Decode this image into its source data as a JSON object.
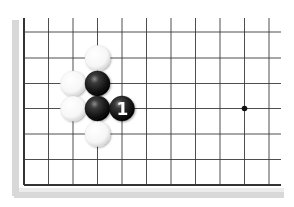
{
  "diagram": {
    "type": "go-board-fragment",
    "colors": {
      "background": "#ffffff",
      "line": "#3a3a3a",
      "edge_line": "#333333",
      "shadow": "#d8d8d8",
      "black_stone": "#1e1e1e",
      "white_stone": "#ffffff",
      "label_on_black": "#ffffff"
    },
    "grid": {
      "x": [
        24,
        48.5,
        73,
        97.5,
        122,
        146.5,
        171,
        195.5,
        220,
        244.5,
        269
      ],
      "y": [
        32,
        58,
        83.5,
        108.5,
        134,
        159.5,
        185
      ],
      "left_edge": true,
      "bottom_edge": true,
      "top_open_to": 18,
      "right_open_to": 281
    },
    "star_points": [
      {
        "col": 9,
        "row": 3
      }
    ],
    "stones": [
      {
        "color": "white",
        "col": 3,
        "row": 1,
        "label": ""
      },
      {
        "color": "white",
        "col": 2,
        "row": 2,
        "label": ""
      },
      {
        "color": "black",
        "col": 3,
        "row": 2,
        "label": ""
      },
      {
        "color": "white",
        "col": 2,
        "row": 3,
        "label": ""
      },
      {
        "color": "black",
        "col": 3,
        "row": 3,
        "label": ""
      },
      {
        "color": "black",
        "col": 4,
        "row": 3,
        "label": "1"
      },
      {
        "color": "white",
        "col": 3,
        "row": 4,
        "label": ""
      }
    ],
    "stone_radius": 12.5
  }
}
